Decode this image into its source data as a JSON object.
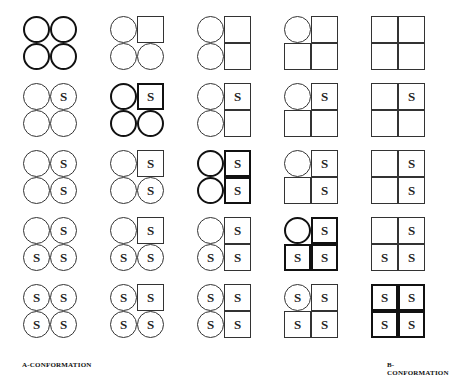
{
  "labels": {
    "left": "A-CONFORMATION",
    "right": "B-CONFORMATION"
  },
  "layout": {
    "col_x": [
      23,
      110,
      197,
      284,
      371
    ],
    "row_y": [
      16,
      83,
      150,
      217,
      284
    ]
  },
  "legend": {
    "circle": "A-subunit",
    "square": "B-subunit",
    "S": "substrate-bound",
    "bold": "symmetric (diagonal) state"
  },
  "rows": [
    {
      "cells": [
        {
          "q": [
            [
              "c",
              ""
            ],
            [
              "c",
              ""
            ],
            [
              "c",
              ""
            ],
            [
              "c",
              ""
            ]
          ],
          "bold": true
        },
        {
          "q": [
            [
              "c",
              ""
            ],
            [
              "s",
              ""
            ],
            [
              "c",
              ""
            ],
            [
              "c",
              ""
            ]
          ],
          "bold": false
        },
        {
          "q": [
            [
              "c",
              ""
            ],
            [
              "s",
              ""
            ],
            [
              "c",
              ""
            ],
            [
              "s",
              ""
            ]
          ],
          "bold": false
        },
        {
          "q": [
            [
              "c",
              ""
            ],
            [
              "s",
              ""
            ],
            [
              "s",
              ""
            ],
            [
              "s",
              ""
            ]
          ],
          "bold": false
        },
        {
          "q": [
            [
              "s",
              ""
            ],
            [
              "s",
              ""
            ],
            [
              "s",
              ""
            ],
            [
              "s",
              ""
            ]
          ],
          "bold": false
        }
      ]
    },
    {
      "cells": [
        {
          "q": [
            [
              "c",
              ""
            ],
            [
              "c",
              "S"
            ],
            [
              "c",
              ""
            ],
            [
              "c",
              ""
            ]
          ],
          "bold": false
        },
        {
          "q": [
            [
              "c",
              ""
            ],
            [
              "s",
              "S"
            ],
            [
              "c",
              ""
            ],
            [
              "c",
              ""
            ]
          ],
          "bold": true
        },
        {
          "q": [
            [
              "c",
              ""
            ],
            [
              "s",
              "S"
            ],
            [
              "c",
              ""
            ],
            [
              "s",
              ""
            ]
          ],
          "bold": false
        },
        {
          "q": [
            [
              "c",
              ""
            ],
            [
              "s",
              "S"
            ],
            [
              "s",
              ""
            ],
            [
              "s",
              ""
            ]
          ],
          "bold": false
        },
        {
          "q": [
            [
              "s",
              ""
            ],
            [
              "s",
              "S"
            ],
            [
              "s",
              ""
            ],
            [
              "s",
              ""
            ]
          ],
          "bold": false
        }
      ]
    },
    {
      "cells": [
        {
          "q": [
            [
              "c",
              ""
            ],
            [
              "c",
              "S"
            ],
            [
              "c",
              ""
            ],
            [
              "c",
              "S"
            ]
          ],
          "bold": false
        },
        {
          "q": [
            [
              "c",
              ""
            ],
            [
              "s",
              "S"
            ],
            [
              "c",
              ""
            ],
            [
              "c",
              "S"
            ]
          ],
          "bold": false
        },
        {
          "q": [
            [
              "c",
              ""
            ],
            [
              "s",
              "S"
            ],
            [
              "c",
              ""
            ],
            [
              "s",
              "S"
            ]
          ],
          "bold": true
        },
        {
          "q": [
            [
              "c",
              ""
            ],
            [
              "s",
              "S"
            ],
            [
              "s",
              ""
            ],
            [
              "s",
              "S"
            ]
          ],
          "bold": false
        },
        {
          "q": [
            [
              "s",
              ""
            ],
            [
              "s",
              "S"
            ],
            [
              "s",
              ""
            ],
            [
              "s",
              "S"
            ]
          ],
          "bold": false
        }
      ]
    },
    {
      "cells": [
        {
          "q": [
            [
              "c",
              ""
            ],
            [
              "c",
              "S"
            ],
            [
              "c",
              "S"
            ],
            [
              "c",
              "S"
            ]
          ],
          "bold": false
        },
        {
          "q": [
            [
              "c",
              ""
            ],
            [
              "s",
              "S"
            ],
            [
              "c",
              "S"
            ],
            [
              "c",
              "S"
            ]
          ],
          "bold": false
        },
        {
          "q": [
            [
              "c",
              ""
            ],
            [
              "s",
              "S"
            ],
            [
              "c",
              "S"
            ],
            [
              "s",
              "S"
            ]
          ],
          "bold": false
        },
        {
          "q": [
            [
              "c",
              ""
            ],
            [
              "s",
              "S"
            ],
            [
              "s",
              "S"
            ],
            [
              "s",
              "S"
            ]
          ],
          "bold": true
        },
        {
          "q": [
            [
              "s",
              ""
            ],
            [
              "s",
              "S"
            ],
            [
              "s",
              "S"
            ],
            [
              "s",
              "S"
            ]
          ],
          "bold": false
        }
      ]
    },
    {
      "cells": [
        {
          "q": [
            [
              "c",
              "S"
            ],
            [
              "c",
              "S"
            ],
            [
              "c",
              "S"
            ],
            [
              "c",
              "S"
            ]
          ],
          "bold": false
        },
        {
          "q": [
            [
              "c",
              "S"
            ],
            [
              "s",
              "S"
            ],
            [
              "c",
              "S"
            ],
            [
              "c",
              "S"
            ]
          ],
          "bold": false
        },
        {
          "q": [
            [
              "c",
              "S"
            ],
            [
              "s",
              "S"
            ],
            [
              "c",
              "S"
            ],
            [
              "s",
              "S"
            ]
          ],
          "bold": false
        },
        {
          "q": [
            [
              "c",
              "S"
            ],
            [
              "s",
              "S"
            ],
            [
              "s",
              "S"
            ],
            [
              "s",
              "S"
            ]
          ],
          "bold": false
        },
        {
          "q": [
            [
              "s",
              "S"
            ],
            [
              "s",
              "S"
            ],
            [
              "s",
              "S"
            ],
            [
              "s",
              "S"
            ]
          ],
          "bold": true
        }
      ]
    }
  ]
}
